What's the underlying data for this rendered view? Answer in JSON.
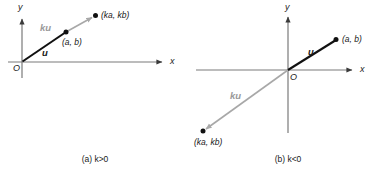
{
  "figure": {
    "title_present": false,
    "panels": [
      {
        "id": "panel-a",
        "caption_prefix": "(a)",
        "caption_expr": "k > 0",
        "caption_full": "(a) k>0",
        "axes": {
          "x_label": "x",
          "y_label": "y",
          "origin_label": "O"
        },
        "vectors": [
          {
            "name": "u",
            "label": "u",
            "color": "#111111",
            "from": [
              22,
              62
            ],
            "to": [
              66,
              32
            ],
            "style": "solid-black"
          },
          {
            "name": "ku",
            "label": "ku",
            "color": "#9a9a9a",
            "from": [
              66,
              32
            ],
            "to": [
              95,
              16
            ],
            "style": "solid-gray-arrow"
          }
        ],
        "points": [
          {
            "label": "(a, b)",
            "at": [
              66,
              32
            ]
          },
          {
            "label": "(ka, kb)",
            "at": [
              95,
              16
            ]
          }
        ]
      },
      {
        "id": "panel-b",
        "caption_prefix": "(b)",
        "caption_expr": "k < 0",
        "caption_full": "(b) k<0",
        "axes": {
          "x_label": "x",
          "y_label": "y",
          "origin_label": "O"
        },
        "vectors": [
          {
            "name": "u",
            "label": "u",
            "color": "#111111",
            "from": [
              288,
              70
            ],
            "to": [
              336,
              40
            ],
            "style": "solid-black"
          },
          {
            "name": "ku",
            "label": "ku",
            "color": "#9a9a9a",
            "from": [
              288,
              70
            ],
            "to": [
              203,
              131
            ],
            "style": "solid-gray-arrow"
          }
        ],
        "points": [
          {
            "label": "(a, b)",
            "at": [
              336,
              40
            ]
          },
          {
            "label": "(ka, kb)",
            "at": [
              203,
              131
            ]
          }
        ]
      }
    ]
  },
  "colors": {
    "ink": "#111111",
    "axis": "#6e6e6e",
    "gray_vector": "#9a9a9a",
    "background": "#ffffff"
  },
  "labels": {
    "a": {
      "y_axis": "y",
      "x_axis": "x",
      "origin": "O",
      "u": "u",
      "ku": "ku",
      "point_ab": "(a, b)",
      "point_kakb": "(ka, kb)",
      "caption": "(a) k>0"
    },
    "b": {
      "y_axis": "y",
      "x_axis": "x",
      "origin": "O",
      "u": "u",
      "ku": "ku",
      "point_ab": "(a, b)",
      "point_kakb": "(ka, kb)",
      "caption": "(b) k<0"
    }
  }
}
